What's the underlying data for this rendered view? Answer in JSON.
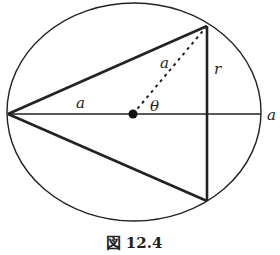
{
  "figure": {
    "caption": "図 12.4",
    "labels": {
      "left_radius": "a",
      "hypotenuse": "a",
      "height": "r",
      "angle": "θ",
      "right_end": "a"
    },
    "colors": {
      "stroke": "#222222",
      "background": "#ffffff"
    },
    "geometry": {
      "ellipse": {
        "cx": 134,
        "cy": 112,
        "rx": 127,
        "ry": 109
      },
      "center": {
        "x": 133,
        "y": 114
      },
      "left_vertex": {
        "x": 8,
        "y": 114
      },
      "top_vertex": {
        "x": 207,
        "y": 26
      },
      "bottom_vertex": {
        "x": 207,
        "y": 201
      },
      "right_point": {
        "x": 261,
        "y": 114
      }
    }
  }
}
